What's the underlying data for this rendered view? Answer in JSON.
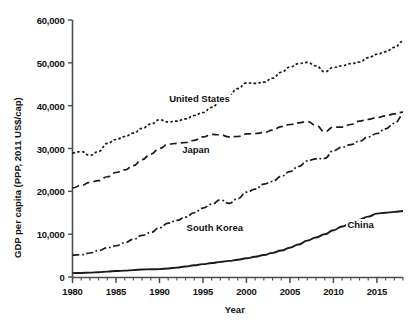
{
  "chart_data": {
    "type": "line",
    "title": "",
    "subtitle": "",
    "xlabel": "Year",
    "ylabel": "GDP per capita (PPP, 2011 US$/cap)",
    "xlim": [
      1980,
      2018
    ],
    "ylim": [
      0,
      60000
    ],
    "grid": false,
    "legend_position": "inline-annotations",
    "x_tick_labels": [
      "1980",
      "1985",
      "1990",
      "1995",
      "2000",
      "2005",
      "2010",
      "2015"
    ],
    "x_tick_values": [
      1980,
      1985,
      1990,
      1995,
      2000,
      2005,
      2010,
      2015
    ],
    "x_minor_tick_interval": 1,
    "y_tick_labels": [
      "0",
      "10,000",
      "20,000",
      "30,000",
      "40,000",
      "50,000",
      "60,000"
    ],
    "y_tick_values": [
      0,
      10000,
      20000,
      30000,
      40000,
      50000,
      60000
    ],
    "x": [
      1980,
      1981,
      1982,
      1983,
      1984,
      1985,
      1986,
      1987,
      1988,
      1989,
      1990,
      1991,
      1992,
      1993,
      1994,
      1995,
      1996,
      1997,
      1998,
      1999,
      2000,
      2001,
      2002,
      2003,
      2004,
      2005,
      2006,
      2007,
      2008,
      2009,
      2010,
      2011,
      2012,
      2013,
      2014,
      2015,
      2016,
      2017,
      2018
    ],
    "series": [
      {
        "name": "United States",
        "line_style": "dotted",
        "color": "#1a1a1a",
        "label_x": 1991.0,
        "label_y": 41500,
        "values": [
          29000,
          29300,
          28400,
          29300,
          31200,
          32100,
          32800,
          33600,
          34700,
          35700,
          36700,
          36200,
          36400,
          36900,
          37700,
          38400,
          39600,
          41000,
          42500,
          44000,
          45300,
          45200,
          45500,
          46400,
          47800,
          49000,
          49800,
          50100,
          49300,
          47900,
          48900,
          49300,
          49800,
          50200,
          51200,
          52000,
          52600,
          53600,
          55000
        ],
        "value_notes": "Steady growth with 1982 recession dip, 1991 dip, and 2008-2009 financial crisis dip; ends ~55,000 in 2018."
      },
      {
        "name": "Japan",
        "line_style": "dashed",
        "color": "#1a1a1a",
        "label_x": 1992.5,
        "label_y": 29600,
        "values": [
          20800,
          21400,
          22100,
          22500,
          23400,
          24400,
          25000,
          26000,
          27400,
          28700,
          30000,
          31000,
          31200,
          31400,
          31900,
          32700,
          33300,
          33200,
          32700,
          32800,
          33400,
          33500,
          33700,
          34300,
          35100,
          35600,
          36000,
          36300,
          35400,
          33900,
          35000,
          35000,
          35600,
          36400,
          36800,
          37200,
          37600,
          38100,
          38500
        ],
        "value_notes": "Rapid rise in the 1980s, flat 1990s stagnation, dip in 2008-2009, ends ~38,500 in 2018."
      },
      {
        "name": "South Korea",
        "line_style": "dashdot",
        "color": "#1a1a1a",
        "label_x": 1993.0,
        "label_y": 11400,
        "values": [
          5100,
          5200,
          5600,
          6200,
          6800,
          7300,
          8000,
          8800,
          9700,
          10400,
          11500,
          12600,
          13200,
          14000,
          15000,
          16100,
          17000,
          18000,
          17200,
          18300,
          19800,
          20500,
          21700,
          22300,
          23500,
          24600,
          25800,
          27100,
          27600,
          27700,
          29500,
          30300,
          30900,
          31700,
          32700,
          33500,
          34600,
          35900,
          37700
        ],
        "value_notes": "Fastest relative growth; brief 1997-98 Asian financial crisis dip; ends ~37,700 in 2018, nearly converging with Japan."
      },
      {
        "name": "China",
        "line_style": "solid",
        "color": "#1a1a1a",
        "label_x": 2011.5,
        "label_y": 12200,
        "values": [
          900,
          950,
          1020,
          1120,
          1260,
          1400,
          1480,
          1610,
          1750,
          1800,
          1850,
          1980,
          2200,
          2450,
          2740,
          3000,
          3260,
          3520,
          3760,
          4030,
          4370,
          4720,
          5120,
          5630,
          6190,
          6840,
          7600,
          8500,
          9230,
          9970,
          10900,
          11800,
          12600,
          13400,
          14100,
          14800,
          15000,
          15200,
          15400
        ],
        "value_notes": "Near-flat until mid-1990s then accelerating growth; ends ~15,400 in 2018."
      }
    ]
  },
  "axes": {
    "x_title": "Year",
    "y_title": "GDP per capita (PPP, 2011 US$/cap)"
  }
}
